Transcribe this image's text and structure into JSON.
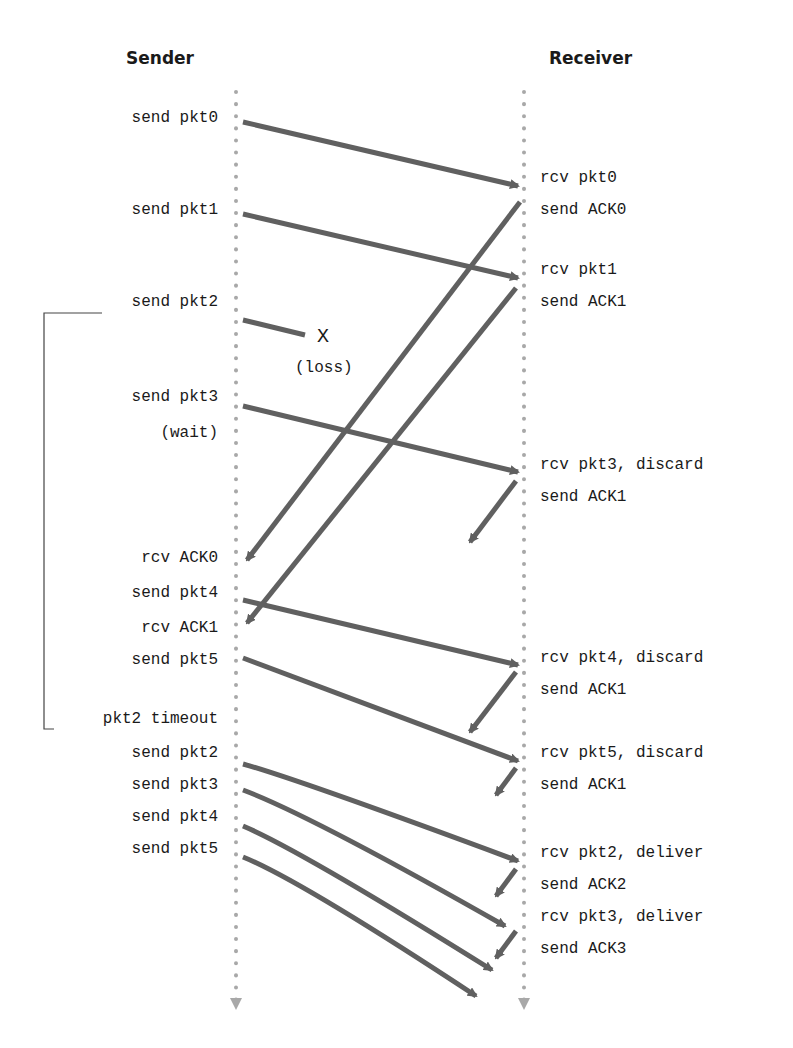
{
  "headers": {
    "sender": "Sender",
    "receiver": "Receiver"
  },
  "sender_labels": [
    {
      "text": "send pkt0",
      "y": 118
    },
    {
      "text": "send pkt1",
      "y": 210
    },
    {
      "text": "send pkt2",
      "y": 302
    },
    {
      "text": "send pkt3",
      "y": 397
    },
    {
      "text": "(wait)",
      "y": 433
    },
    {
      "text": "rcv ACK0",
      "y": 558
    },
    {
      "text": "send pkt4",
      "y": 593
    },
    {
      "text": "rcv ACK1",
      "y": 628
    },
    {
      "text": "send pkt5",
      "y": 660
    },
    {
      "text": "pkt2 timeout",
      "y": 719
    },
    {
      "text": "send pkt2",
      "y": 753
    },
    {
      "text": "send pkt3",
      "y": 785
    },
    {
      "text": "send pkt4",
      "y": 817
    },
    {
      "text": "send pkt5",
      "y": 849
    }
  ],
  "receiver_labels": [
    {
      "text": "rcv pkt0",
      "y": 178
    },
    {
      "text": "send ACK0",
      "y": 210
    },
    {
      "text": "rcv pkt1",
      "y": 270
    },
    {
      "text": "send ACK1",
      "y": 302
    },
    {
      "text": "rcv pkt3, discard",
      "y": 465
    },
    {
      "text": "send ACK1",
      "y": 497
    },
    {
      "text": "rcv pkt4, discard",
      "y": 658
    },
    {
      "text": "send ACK1",
      "y": 690
    },
    {
      "text": "rcv pkt5, discard",
      "y": 753
    },
    {
      "text": "send ACK1",
      "y": 785
    },
    {
      "text": "rcv pkt2, deliver",
      "y": 853
    },
    {
      "text": "send ACK2",
      "y": 885
    },
    {
      "text": "rcv pkt3, deliver",
      "y": 917
    },
    {
      "text": "send ACK3",
      "y": 949
    }
  ],
  "loss": {
    "mark": "X",
    "label": "(loss)"
  },
  "colors": {
    "arrow": "#606060",
    "timeline": "#a8a8a8",
    "text": "#1a1a1a"
  }
}
